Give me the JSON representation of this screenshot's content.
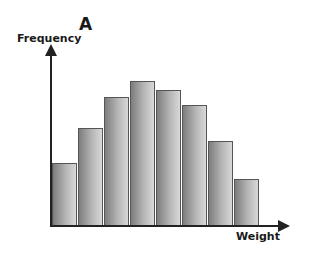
{
  "chart_data": {
    "type": "bar",
    "title": "A",
    "xlabel": "Weight",
    "ylabel": "Frequency",
    "categories": [
      "1",
      "2",
      "3",
      "4",
      "5",
      "6",
      "7",
      "8"
    ],
    "values": [
      62,
      97,
      128,
      144,
      135,
      120,
      84,
      46
    ],
    "value_note": "Relative bar heights in pixels; axes have no tick labels",
    "grid": false,
    "legend": null,
    "bar_color": "#a0a0a0"
  }
}
